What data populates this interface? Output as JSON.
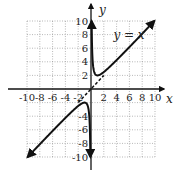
{
  "chart_data": {
    "type": "line",
    "title": "",
    "xlabel": "x",
    "ylabel": "y",
    "xlim": [
      -10,
      10
    ],
    "ylim": [
      -10,
      10
    ],
    "grid": true,
    "x_ticks": [
      "-10",
      "-8",
      "-6",
      "-4",
      "-2",
      "2",
      "4",
      "6",
      "8",
      "10"
    ],
    "y_ticks": [
      "10",
      "8",
      "6",
      "4",
      "2",
      "-4",
      "-6",
      "-8",
      "-10"
    ],
    "series": [
      {
        "name": "f(x) = x + 1/x",
        "function": "x + 1/x",
        "style": "solid",
        "branches": [
          [
            -9.9,
            -0.1
          ],
          [
            0.1,
            9.9
          ]
        ]
      },
      {
        "name": "asymptote y = x",
        "function": "x",
        "style": "dashed",
        "domain": [
          -2,
          2
        ]
      }
    ],
    "annotations": [
      {
        "text": "y = x",
        "x": 3.5,
        "y": 8
      }
    ]
  }
}
